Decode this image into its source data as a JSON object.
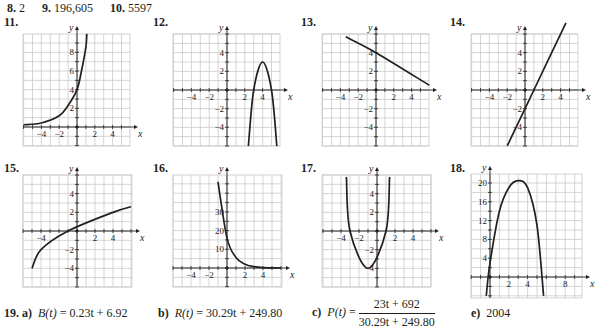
{
  "top_answers": [
    {
      "number": "8.",
      "value": "2"
    },
    {
      "number": "9.",
      "value": "196,605"
    },
    {
      "number": "10.",
      "value": "5597"
    }
  ],
  "chart_data": [
    {
      "id": "11",
      "type": "line",
      "title": "11.",
      "function": "exponential increasing, y ≈ 4·(1.6)^x",
      "xlabel": "x",
      "ylabel": "y",
      "xlim": [
        -6,
        6
      ],
      "ylim": [
        -2,
        10
      ],
      "x_ticks_labeled": [
        "-4",
        "-2",
        "2",
        "4"
      ],
      "y_ticks_labeled": [
        "2",
        "4",
        "6",
        "8"
      ],
      "grid": true,
      "points": [
        [
          -6,
          0.24
        ],
        [
          -4,
          0.43
        ],
        [
          -2,
          1.2
        ],
        [
          -1,
          2.3
        ],
        [
          0,
          4
        ],
        [
          0.5,
          6
        ],
        [
          1,
          8.6
        ],
        [
          1.1,
          10
        ]
      ]
    },
    {
      "id": "12",
      "type": "line",
      "title": "12.",
      "function": "downward parabola, vertex (4,3), y = -3(x-4)^2 + 3",
      "xlabel": "x",
      "ylabel": "y",
      "xlim": [
        -6,
        6
      ],
      "ylim": [
        -6,
        6
      ],
      "x_ticks_labeled": [
        "-4",
        "-2",
        "2",
        "4"
      ],
      "y_ticks_labeled": [
        "4",
        "2",
        "-2",
        "-4"
      ],
      "grid": true,
      "points": [
        [
          2.4,
          -6
        ],
        [
          3,
          0
        ],
        [
          4,
          3
        ],
        [
          5,
          0
        ],
        [
          5.6,
          -6
        ]
      ]
    },
    {
      "id": "13",
      "type": "line",
      "title": "13.",
      "function": "line, y = -0.5x + 4",
      "xlabel": "x",
      "ylabel": "y",
      "xlim": [
        -6,
        6
      ],
      "ylim": [
        -6,
        6
      ],
      "x_ticks_labeled": [
        "-4",
        "-2",
        "2",
        "4"
      ],
      "y_ticks_labeled": [
        "4",
        "2",
        "-2",
        "-4"
      ],
      "grid": true,
      "points": [
        [
          -3.4,
          5.7
        ],
        [
          0,
          4
        ],
        [
          6,
          0.5
        ]
      ]
    },
    {
      "id": "14",
      "type": "line",
      "title": "14.",
      "function": "line, y = 2x - 2",
      "xlabel": "x",
      "ylabel": "y",
      "xlim": [
        -6,
        6
      ],
      "ylim": [
        -6,
        6
      ],
      "x_ticks_labeled": [
        "-4",
        "-2",
        "2",
        "4"
      ],
      "y_ticks_labeled": [
        "4",
        "2",
        "-2",
        "-4"
      ],
      "grid": true,
      "points": [
        [
          -2,
          -6
        ],
        [
          1,
          0
        ],
        [
          4.6,
          7.2
        ]
      ]
    },
    {
      "id": "15",
      "type": "line",
      "title": "15.",
      "function": "square root, y = 2√(x+5) − 4",
      "xlabel": "x",
      "ylabel": "y",
      "xlim": [
        -6,
        6
      ],
      "ylim": [
        -6,
        6
      ],
      "x_ticks_labeled": [
        "-4",
        "2",
        "4"
      ],
      "y_ticks_labeled": [
        "4",
        "2",
        "-2",
        "-4"
      ],
      "grid": true,
      "points": [
        [
          -5,
          -4
        ],
        [
          -4,
          -2
        ],
        [
          -1,
          0
        ],
        [
          4,
          2
        ],
        [
          6,
          2.6
        ]
      ]
    },
    {
      "id": "16",
      "type": "line",
      "title": "16.",
      "function": "exponential decay, y ≈ 16·(0.35)^x",
      "xlabel": "x",
      "ylabel": "y",
      "xlim": [
        -6,
        6
      ],
      "ylim": [
        -5,
        55
      ],
      "x_ticks_labeled": [
        "-4",
        "-2",
        "2",
        "4"
      ],
      "y_ticks_labeled": [
        "10",
        "20",
        "30"
      ],
      "grid": true,
      "points": [
        [
          -1,
          46
        ],
        [
          0,
          16
        ],
        [
          1,
          5.6
        ],
        [
          2,
          2
        ],
        [
          3,
          0.7
        ],
        [
          4,
          0.2
        ],
        [
          6,
          0
        ]
      ]
    },
    {
      "id": "17",
      "type": "line",
      "title": "17.",
      "function": "upward parabola, y = (x+1)^2 − 4",
      "xlabel": "x",
      "ylabel": "y",
      "xlim": [
        -6,
        6
      ],
      "ylim": [
        -6,
        6
      ],
      "x_ticks_labeled": [
        "-4",
        "-2",
        "2",
        "4"
      ],
      "y_ticks_labeled": [
        "4",
        "2",
        "-2",
        "-4"
      ],
      "grid": true,
      "points": [
        [
          -3.4,
          5.8
        ],
        [
          -3,
          0
        ],
        [
          -1,
          -4
        ],
        [
          1,
          0
        ],
        [
          1.4,
          5.8
        ]
      ]
    },
    {
      "id": "18",
      "type": "line",
      "title": "18.",
      "function": "downward parabola, vertex ≈ (3, 20.5)",
      "xlabel": "x",
      "ylabel": "y",
      "xlim": [
        -1,
        10
      ],
      "ylim": [
        -4,
        22
      ],
      "x_ticks_labeled": [
        "2",
        "4",
        "8"
      ],
      "y_ticks_labeled": [
        "4",
        "8",
        "12",
        "16",
        "20"
      ],
      "grid": true,
      "points": [
        [
          -0.4,
          -4
        ],
        [
          0,
          3
        ],
        [
          1,
          14
        ],
        [
          2,
          19
        ],
        [
          3,
          20.5
        ],
        [
          4,
          19
        ],
        [
          5,
          11
        ],
        [
          5.7,
          -4
        ]
      ]
    }
  ],
  "problem19": {
    "number": "19.",
    "a": {
      "label": "a)",
      "lhs": "B(t)",
      "eq": " = ",
      "rhs": "0.23t + 6.92"
    },
    "b": {
      "label": "b)",
      "lhs": "R(t)",
      "eq": " = ",
      "rhs": "30.29t + 249.80"
    },
    "c": {
      "label": "c)",
      "lhs": "P(t)",
      "eq": " = ",
      "numerator": "23t + 692",
      "denominator": "30.29t + 249.80"
    },
    "e": {
      "label": "e)",
      "value": "2004"
    }
  }
}
